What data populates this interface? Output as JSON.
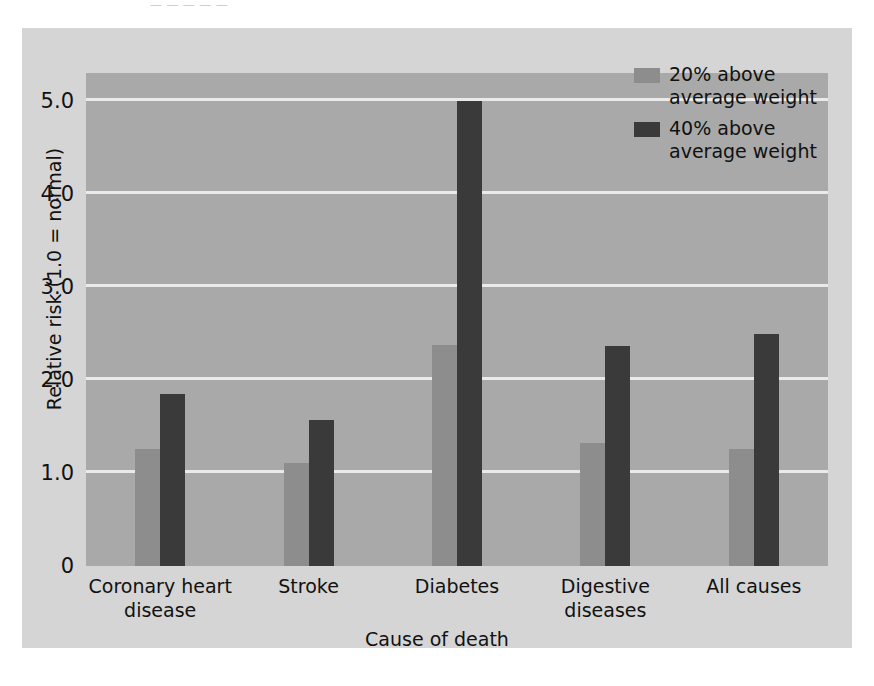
{
  "page": {
    "top_cutoff_text": "— — — — —"
  },
  "legend": {
    "position": "top-right",
    "entries": [
      {
        "label": "20% above\naverage weight",
        "color": "#8d8d8d",
        "swatch_name": "legend-swatch-20-percent"
      },
      {
        "label": "40% above\naverage weight",
        "color": "#3a3a3a",
        "swatch_name": "legend-swatch-40-percent"
      }
    ]
  },
  "chart_data": {
    "type": "bar",
    "title": "",
    "subtitle": "",
    "xlabel": "Cause of death",
    "ylabel": "Relative risk (1.0 = normal)",
    "categories": [
      "Coronary heart\ndisease",
      "Stroke",
      "Diabetes",
      "Digestive\ndiseases",
      "All causes"
    ],
    "series": [
      {
        "name": "20% above average weight",
        "color": "#8d8d8d",
        "values": [
          1.26,
          1.11,
          2.38,
          1.32,
          1.26
        ]
      },
      {
        "name": "40% above average weight",
        "color": "#3a3a3a",
        "values": [
          1.85,
          1.57,
          5.0,
          2.36,
          2.49
        ]
      }
    ],
    "ylim": [
      0,
      5.3
    ],
    "yticks": [
      0,
      1.0,
      2.0,
      3.0,
      4.0,
      5.0
    ],
    "ytick_labels": [
      "0",
      "1.0",
      "2.0",
      "3.0",
      "4.0",
      "5.0"
    ],
    "grid": true,
    "grid_color": "#eaeaea",
    "plot_background": "#a9a9a9",
    "figure_background": "#d5d5d5",
    "legend_position": "upper right"
  }
}
